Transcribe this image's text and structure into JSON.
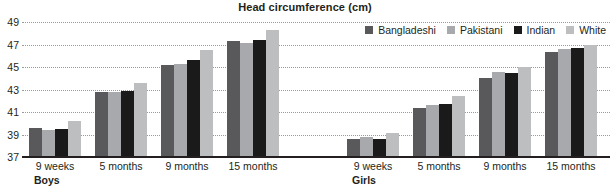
{
  "chart_data": {
    "type": "bar",
    "title": "Head circumference (cm)",
    "xlabel": "",
    "ylabel": "",
    "ylim": [
      37,
      49
    ],
    "yticks": [
      37,
      39,
      41,
      43,
      45,
      47,
      49
    ],
    "grid": true,
    "legend_position": "top-right",
    "legend": [
      "Bangladeshi",
      "Pakistani",
      "Indian",
      "White"
    ],
    "series_colors": {
      "Bangladeshi": "#59595b",
      "Pakistani": "#a7a9ac",
      "Indian": "#1a1a1a",
      "White": "#bcbec0"
    },
    "panels": [
      {
        "name": "Boys",
        "categories": [
          "9 weeks",
          "5 months",
          "9 months",
          "15 months"
        ],
        "series": [
          {
            "name": "Bangladeshi",
            "values": [
              39.6,
              42.8,
              45.2,
              47.3
            ]
          },
          {
            "name": "Pakistani",
            "values": [
              39.4,
              42.8,
              45.3,
              47.1
            ]
          },
          {
            "name": "Indian",
            "values": [
              39.5,
              42.9,
              45.6,
              47.4
            ]
          },
          {
            "name": "White",
            "values": [
              40.2,
              43.6,
              46.5,
              48.3
            ]
          }
        ]
      },
      {
        "name": "Girls",
        "categories": [
          "9 weeks",
          "5 months",
          "9 months",
          "15 months"
        ],
        "series": [
          {
            "name": "Bangladeshi",
            "values": [
              38.6,
              41.4,
              44.0,
              46.3
            ]
          },
          {
            "name": "Pakistani",
            "values": [
              38.8,
              41.6,
              44.6,
              46.6
            ]
          },
          {
            "name": "Indian",
            "values": [
              38.6,
              41.7,
              44.5,
              46.7
            ]
          },
          {
            "name": "White",
            "values": [
              39.1,
              42.4,
              45.0,
              47.0
            ]
          }
        ]
      }
    ]
  }
}
